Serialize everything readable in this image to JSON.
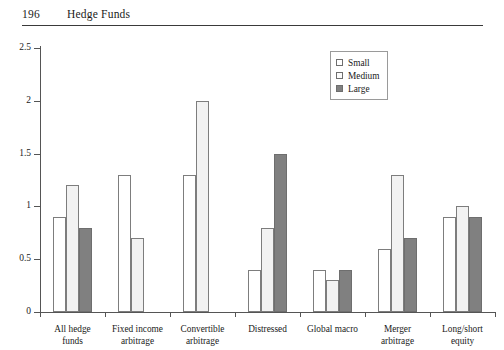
{
  "header": {
    "folio": "196",
    "title": "Hedge Funds"
  },
  "chart_data": {
    "type": "bar",
    "title": "",
    "xlabel": "",
    "ylabel": "",
    "ylim": [
      0,
      2.5
    ],
    "yticks": [
      "0",
      "0.5",
      "1",
      "1.5",
      "2",
      "2.5"
    ],
    "grid": false,
    "legend_position": "top-right",
    "categories": [
      "All hedge funds",
      "Fixed income arbitrage",
      "Convertible arbitrage",
      "Distressed",
      "Global macro",
      "Merger arbitrage",
      "Long/short equity"
    ],
    "category_lines": [
      [
        "All hedge",
        "funds"
      ],
      [
        "Fixed income",
        "arbitrage"
      ],
      [
        "Convertible",
        "arbitrage"
      ],
      [
        "Distressed"
      ],
      [
        "Global macro"
      ],
      [
        "Merger",
        "arbitrage"
      ],
      [
        "Long/short",
        "equity"
      ]
    ],
    "series": [
      {
        "name": "Small",
        "color": "#ffffff",
        "values": [
          0.9,
          1.3,
          1.3,
          0.4,
          0.4,
          0.6,
          0.9
        ]
      },
      {
        "name": "Medium",
        "color": "#f2f2f2",
        "values": [
          1.2,
          0.7,
          2.0,
          0.8,
          0.3,
          1.3,
          1.0
        ]
      },
      {
        "name": "Large",
        "color": "#808080",
        "values": [
          0.8,
          null,
          null,
          1.5,
          0.4,
          0.7,
          0.9
        ]
      }
    ]
  },
  "legend": {
    "items": [
      {
        "label": "Small"
      },
      {
        "label": "Medium"
      },
      {
        "label": "Large"
      }
    ]
  }
}
